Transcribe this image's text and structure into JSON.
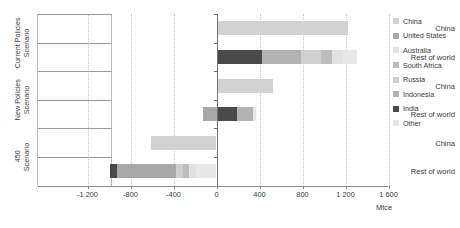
{
  "chart_data": {
    "type": "bar",
    "orientation": "horizontal",
    "stacked": true,
    "title": "",
    "xlabel": "Mtce",
    "ylabel": "",
    "xlim": [
      -1400,
      1600
    ],
    "xticks": [
      -1200,
      -800,
      -400,
      0,
      400,
      800,
      1200,
      1600
    ],
    "xtick_labels": [
      "-1 200",
      "-800",
      "-400",
      "0",
      "400",
      "800",
      "1 200",
      "1 600"
    ],
    "grid": "vertical-dotted",
    "legend_position": "right",
    "legend": [
      "China",
      "United States",
      "Australia",
      "South Africa",
      "Russia",
      "Indonesia",
      "India",
      "Other"
    ],
    "groups": [
      {
        "name": "Current Policies Scenario",
        "rows": [
          {
            "category": "China",
            "segments": [
              {
                "series": "China",
                "value": 1225
              }
            ]
          },
          {
            "category": "Rest of world",
            "segments": [
              {
                "series": "India",
                "value": 420
              },
              {
                "series": "Indonesia",
                "value": 370
              },
              {
                "series": "Russia",
                "value": 185
              },
              {
                "series": "South Africa",
                "value": 100
              },
              {
                "series": "Australia",
                "value": 100
              },
              {
                "series": "Other",
                "value": 130
              }
            ]
          }
        ]
      },
      {
        "name": "New Policies Scenario",
        "rows": [
          {
            "category": "China",
            "segments": [
              {
                "series": "China",
                "value": 530
              }
            ]
          },
          {
            "category": "Rest of world",
            "segments": [
              {
                "series": "United States",
                "value": -125
              },
              {
                "series": "India",
                "value": 190
              },
              {
                "series": "Indonesia",
                "value": 150
              },
              {
                "series": "Other",
                "value": 30
              }
            ]
          }
        ]
      },
      {
        "name": "450 Scenario",
        "rows": [
          {
            "category": "China",
            "segments": [
              {
                "series": "China",
                "value": -610
              }
            ]
          },
          {
            "category": "Rest of world",
            "segments": [
              {
                "series": "Other",
                "value": -195
              },
              {
                "series": "Australia",
                "value": -60
              },
              {
                "series": "South Africa",
                "value": -55
              },
              {
                "series": "Russia",
                "value": -70
              },
              {
                "series": "United States",
                "value": -550
              },
              {
                "series": "India",
                "value": -65
              }
            ]
          }
        ]
      }
    ],
    "colors": {
      "China": "#d2d2d2",
      "United States": "#a8a8a8",
      "Australia": "#e2e2e2",
      "South Africa": "#bdbdbd",
      "Russia": "#cfcfcf",
      "Indonesia": "#b3b3b3",
      "India": "#4a4a4a",
      "Other": "#e8e8e8"
    },
    "axis_color": "#8a8a8a",
    "grid_color": "#c9c9c9",
    "text_color": "#3b3b3b"
  }
}
